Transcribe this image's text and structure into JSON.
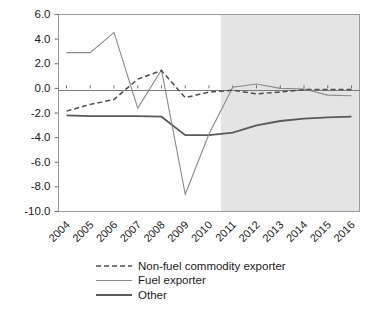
{
  "chart_data": {
    "type": "line",
    "title": "",
    "subtitle": "",
    "xlabel": "",
    "ylabel": "",
    "categories": [
      "2004",
      "2005",
      "2006",
      "2007",
      "2008",
      "2009",
      "2010",
      "2011",
      "2012",
      "2013",
      "2014",
      "2015",
      "2016"
    ],
    "x": [
      2004,
      2005,
      2006,
      2007,
      2008,
      2009,
      2010,
      2011,
      2012,
      2013,
      2014,
      2015,
      2016
    ],
    "ylim": [
      -10.0,
      6.0
    ],
    "ytick_values": [
      6.0,
      4.0,
      2.0,
      0.0,
      -2.0,
      -4.0,
      -6.0,
      -8.0,
      -10.0
    ],
    "ytick_labels": [
      "6.0",
      "4.0",
      "2.0",
      "0.0",
      "-2.0",
      "-4.0",
      "-6.0",
      "-8.0",
      "-10.0"
    ],
    "grid": false,
    "legend_position": "bottom-left",
    "zero_line": 0.0,
    "annotations": {
      "forecast_shading_start": 2010.5,
      "forecast_shading_end": 2016,
      "forecast_shading_color": "#e4e4e4"
    },
    "series": [
      {
        "name": "Non-fuel commodity exporter",
        "style": "dashed",
        "color": "#4d4d4d",
        "values": [
          -1.85,
          -1.3,
          -0.9,
          0.75,
          1.45,
          -0.75,
          -0.3,
          -0.15,
          -0.45,
          -0.3,
          -0.1,
          -0.1,
          -0.1
        ]
      },
      {
        "name": "Fuel exporter",
        "style": "solid-thin",
        "color": "#8a8a8a",
        "values": [
          2.9,
          2.9,
          4.55,
          -1.6,
          1.5,
          -8.6,
          -3.7,
          0.1,
          0.35,
          0.0,
          -0.05,
          -0.55,
          -0.6
        ]
      },
      {
        "name": "Other",
        "style": "solid-thick",
        "color": "#595959",
        "values": [
          -2.2,
          -2.25,
          -2.25,
          -2.25,
          -2.3,
          -3.8,
          -3.8,
          -3.6,
          -3.0,
          -2.65,
          -2.45,
          -2.35,
          -2.3
        ]
      }
    ]
  },
  "axis": {
    "ytick_labels": [
      "6.0",
      "4.0",
      "2.0",
      "0.0",
      "-2.0",
      "-4.0",
      "-6.0",
      "-8.0",
      "-10.0"
    ],
    "xtick_labels": [
      "2004",
      "2005",
      "2006",
      "2007",
      "2008",
      "2009",
      "2010",
      "2011",
      "2012",
      "2013",
      "2014",
      "2015",
      "2016"
    ]
  },
  "legend": {
    "items": [
      {
        "label": "Non-fuel commodity exporter",
        "style": "dashed"
      },
      {
        "label": "Fuel exporter",
        "style": "solid-thin"
      },
      {
        "label": "Other",
        "style": "solid-thick"
      }
    ]
  },
  "colors": {
    "forecast_band": "#e4e4e4",
    "nonfuel": "#4d4d4d",
    "fuel": "#8a8a8a",
    "other": "#595959",
    "frame": "#9a9a9a",
    "text": "#1a1a1a"
  }
}
